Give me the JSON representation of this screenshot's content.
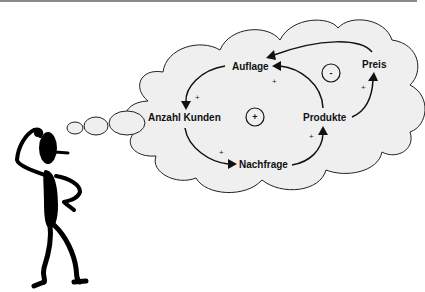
{
  "diagram": {
    "type": "causal-loop-diagram-in-thought-bubble",
    "nodes": {
      "auflage": "Auflage",
      "anzahl_kunden": "Anzahl Kunden",
      "nachfrage": "Nachfrage",
      "produkte": "Produkte",
      "preis": "Preis"
    },
    "edges": [
      {
        "from": "Auflage",
        "to": "Anzahl Kunden",
        "polarity": "+"
      },
      {
        "from": "Anzahl Kunden",
        "to": "Nachfrage",
        "polarity": "+"
      },
      {
        "from": "Nachfrage",
        "to": "Produkte",
        "polarity": "+"
      },
      {
        "from": "Produkte",
        "to": "Auflage",
        "polarity": "+"
      },
      {
        "from": "Produkte",
        "to": "Preis",
        "polarity": "+"
      },
      {
        "from": "Preis",
        "to": "Auflage",
        "polarity": ""
      }
    ],
    "loops": {
      "reinforcing": "+",
      "balancing": "-"
    },
    "polarity_mark": "+",
    "figure": "thinking-stick-figure",
    "colors": {
      "cloud_fill": "#efefef",
      "outline": "#222222",
      "figure": "#000000"
    }
  }
}
